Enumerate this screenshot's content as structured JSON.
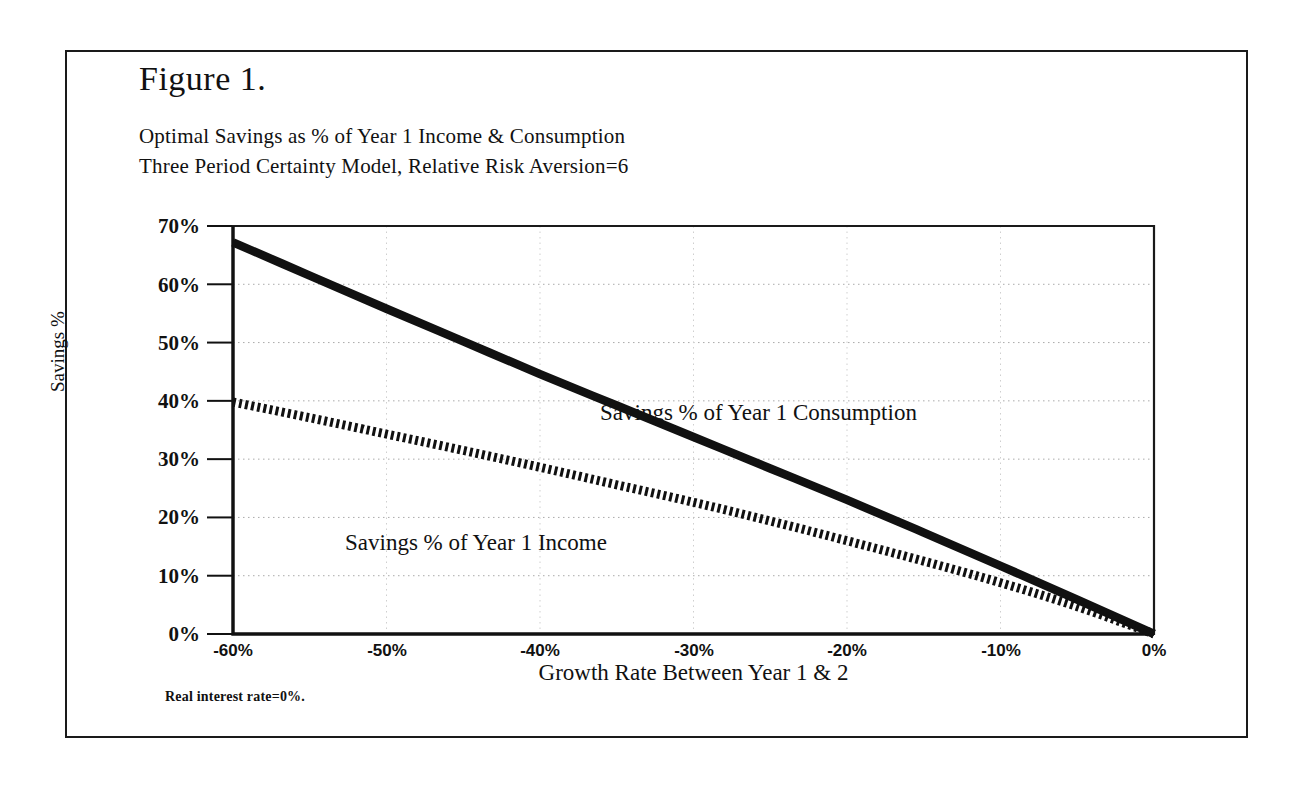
{
  "figure": {
    "label": "Figure 1.",
    "subtitle_line_1": "Optimal Savings as % of Year 1 Income & Consumption",
    "subtitle_line_2": "Three Period Certainty Model, Relative Risk Aversion=6",
    "footnote": "Real interest rate=0%."
  },
  "chart_data": {
    "type": "line",
    "title": "Optimal Savings as % of Year 1 Income & Consumption",
    "subtitle": "Three Period Certainty Model, Relative Risk Aversion=6",
    "xlabel": "Growth Rate Between Year 1 & 2",
    "ylabel": "Savings %",
    "xlim": [
      -60,
      0
    ],
    "ylim": [
      0,
      70
    ],
    "grid": true,
    "legend_position": "inline-annotations",
    "x_tick_labels": [
      "-60%",
      "-50%",
      "-40%",
      "-30%",
      "-20%",
      "-10%",
      "0%"
    ],
    "x_tick_values": [
      -60,
      -50,
      -40,
      -30,
      -20,
      -10,
      0
    ],
    "y_tick_labels": [
      "0%",
      "10%",
      "20%",
      "30%",
      "40%",
      "50%",
      "60%",
      "70%"
    ],
    "y_tick_values": [
      0,
      10,
      20,
      30,
      40,
      50,
      60,
      70
    ],
    "x": [
      -60,
      -55,
      -50,
      -45,
      -40,
      -35,
      -30,
      -25,
      -20,
      -15,
      -10,
      -5,
      0
    ],
    "series": [
      {
        "name": "Savings % of Year 1 Consumption",
        "style": "solid-thick",
        "color": "#111111",
        "values": [
          67.2,
          61.5,
          55.8,
          50.2,
          44.6,
          39.2,
          33.8,
          28.4,
          23.0,
          17.4,
          11.7,
          5.9,
          0.0
        ]
      },
      {
        "name": "Savings % of Year 1 Income",
        "style": "dashed-thick",
        "color": "#111111",
        "values": [
          39.8,
          37.1,
          34.3,
          31.5,
          28.6,
          25.6,
          22.6,
          19.4,
          16.0,
          12.5,
          8.8,
          4.7,
          0.0
        ]
      }
    ],
    "annotations": [
      {
        "text": "Savings % of Year 1 Consumption",
        "x": -36,
        "y": 36
      },
      {
        "text": "Savings % of Year 1 Income",
        "x": -50,
        "y": 14
      }
    ]
  },
  "axes": {
    "y_title": "Savings %",
    "x_title": "Growth Rate Between Year 1 & 2"
  },
  "colors": {
    "ink": "#111111",
    "frame": "#1a1a1a",
    "grid": "#aaaaaa",
    "background": "#ffffff"
  }
}
